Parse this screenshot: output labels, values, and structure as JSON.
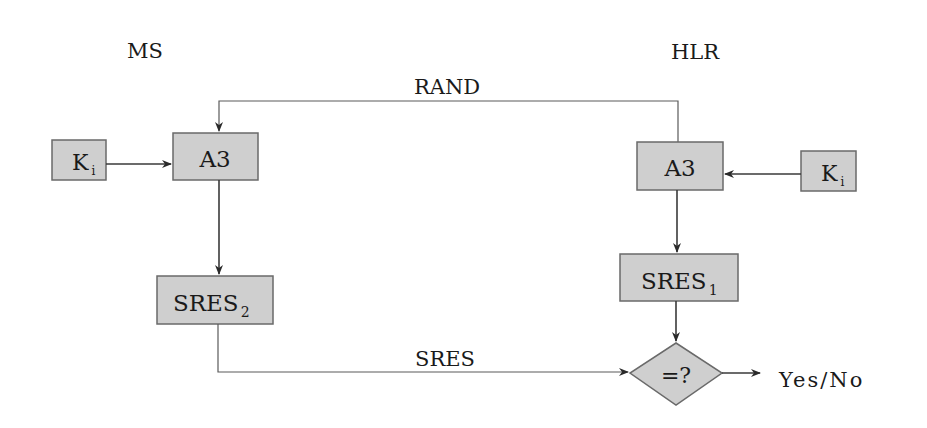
{
  "diagram": {
    "type": "GSM authentication flow",
    "entities": {
      "ms": "MS",
      "hlr": "HLR"
    },
    "nodes": {
      "ms_ki": {
        "main": "K",
        "sub": "i"
      },
      "ms_a3": {
        "main": "A3"
      },
      "ms_sres": {
        "main": "SRES",
        "sub": "2"
      },
      "hlr_ki": {
        "main": "K",
        "sub": "i"
      },
      "hlr_a3": {
        "main": "A3"
      },
      "hlr_sres": {
        "main": "SRES",
        "sub": "1"
      },
      "compare": {
        "main": "=?"
      }
    },
    "edges": {
      "rand": "RAND",
      "sres": "SRES"
    },
    "result": "Yes/No",
    "colors": {
      "box_fill": "#cfcfcf",
      "box_stroke": "#6a6a6a",
      "line": "#3a3a3a",
      "text": "#1a1a1a"
    }
  }
}
